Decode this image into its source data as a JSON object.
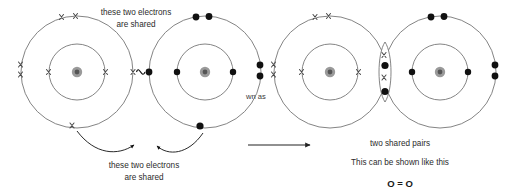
{
  "canvas": {
    "width": 514,
    "height": 193,
    "background": "#ffffff"
  },
  "colors": {
    "shell_stroke": "#6e6e6e",
    "electron_dot": "#111111",
    "electron_cross": "#4a4a4a",
    "nucleus_outer": "#9a9a9a",
    "nucleus_inner": "#555555",
    "text": "#2b2b2b",
    "arrow": "#111111"
  },
  "annotations": {
    "top_label_line1": "these two electrons",
    "top_label_line2": "are shared",
    "bottom_label_line1": "these two electrons",
    "bottom_label_line2": "are shared",
    "clipped_fragment": "wn as",
    "right_caption": "two shared pairs",
    "right_subcaption": "This can be shown like this",
    "formula": "O = O"
  },
  "left_diagram": {
    "description": "two separate oxygen atoms with unpaired outer electrons approaching",
    "atom_a": {
      "label": "oxygen-atom-left",
      "center": {
        "x": 77,
        "y": 72
      },
      "inner_shell_radius": 28,
      "outer_shell_radius": 56,
      "electron_symbol": "x",
      "electron_count_shown": 10
    },
    "atom_b": {
      "label": "oxygen-atom-right",
      "center": {
        "x": 205,
        "y": 72
      },
      "inner_shell_radius": 28,
      "outer_shell_radius": 56,
      "electron_symbol": "dot",
      "electron_count_shown": 10
    },
    "connector": "squiggle-between-unpaired-electrons"
  },
  "right_diagram": {
    "description": "oxygen molecule O2 with two overlapping shells sharing two pairs",
    "atom_a": {
      "label": "oxygen-atom-left",
      "center": {
        "x": 330,
        "y": 72
      },
      "inner_shell_radius": 28,
      "outer_shell_radius": 56,
      "electron_symbol": "x"
    },
    "atom_b": {
      "label": "oxygen-atom-right",
      "center": {
        "x": 440,
        "y": 72
      },
      "inner_shell_radius": 28,
      "outer_shell_radius": 56,
      "electron_symbol": "dot"
    },
    "overlap": {
      "label": "shared-electron-lens",
      "center": {
        "x": 385,
        "y": 72
      },
      "electrons_top_to_bottom": [
        "x",
        "dot",
        "x",
        "dot"
      ],
      "pairs": 2
    }
  },
  "transition_arrow": {
    "label": "reaction-arrow",
    "from": {
      "x": 248,
      "y": 145
    },
    "to": {
      "x": 312,
      "y": 145
    },
    "direction": "right"
  }
}
